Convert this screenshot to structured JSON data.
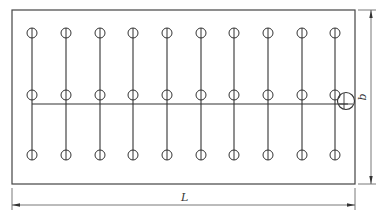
{
  "diagram": {
    "type": "well-point layout plan",
    "labels": {
      "length": "L",
      "width": "b"
    },
    "grid": {
      "columns": 10,
      "rows": 3,
      "column_x": [
        32,
        66,
        100,
        133,
        167,
        201,
        234,
        268,
        302,
        335
      ],
      "row_y": [
        33,
        95,
        155
      ]
    },
    "colors": {
      "stroke": "#333333",
      "background": "#ffffff"
    }
  }
}
